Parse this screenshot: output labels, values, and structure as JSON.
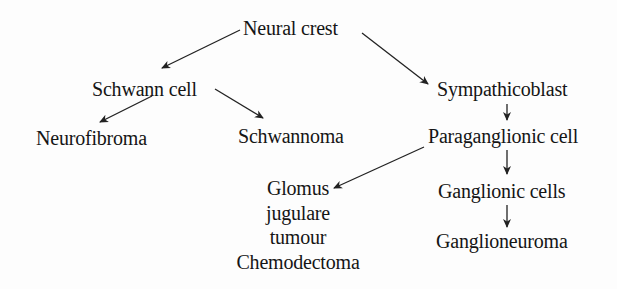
{
  "diagram": {
    "type": "flowchart",
    "nodes": {
      "neural_crest": "Neural crest",
      "schwann_cell": "Schwann cell",
      "sympathicoblast": "Sympathicoblast",
      "neurofibroma": "Neurofibroma",
      "schwannoma": "Schwannoma",
      "paraganglionic_cell": "Paraganglionic cell",
      "glomus": {
        "line1": "Glomus",
        "line2": "jugulare",
        "line3": "tumour",
        "line4": "Chemodectoma"
      },
      "ganglionic_cells": "Ganglionic cells",
      "ganglioneuroma": "Ganglioneuroma"
    },
    "edges": [
      {
        "from": "Neural crest",
        "to": "Schwann cell"
      },
      {
        "from": "Neural crest",
        "to": "Sympathicoblast"
      },
      {
        "from": "Schwann cell",
        "to": "Neurofibroma"
      },
      {
        "from": "Schwann cell",
        "to": "Schwannoma"
      },
      {
        "from": "Sympathicoblast",
        "to": "Paraganglionic cell"
      },
      {
        "from": "Paraganglionic cell",
        "to": "Glomus jugulare tumour Chemodectoma"
      },
      {
        "from": "Paraganglionic cell",
        "to": "Ganglionic cells"
      },
      {
        "from": "Ganglionic cells",
        "to": "Ganglioneuroma"
      }
    ],
    "colors": {
      "text": "#151515",
      "arrow": "#222222",
      "background": "#fdfdfd"
    }
  }
}
